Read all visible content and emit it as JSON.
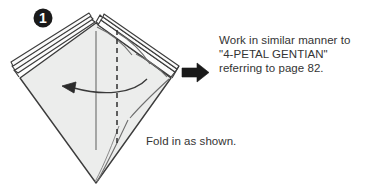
{
  "figure": {
    "kind": "origami-folding-instruction-diagram",
    "step_badge": {
      "number": "1",
      "shape": "filled-circle",
      "fill_color": "#1a1a1a",
      "text_color": "#ffffff"
    },
    "paper": {
      "fill_color": "#ecedec",
      "outline_color": "#3c3c3c",
      "shape": "kite",
      "layer_count_left": 3,
      "layer_count_right": 3
    },
    "fold_line": {
      "style": "dashed",
      "color": "#2f2f2f",
      "orientation": "vertical",
      "label": "valley-fold-line"
    },
    "center_line": {
      "style": "solid",
      "color": "#6b6b6b",
      "orientation": "vertical"
    },
    "fold_arrow": {
      "direction": "right-to-left",
      "style": "curved",
      "color": "#3a3a3a"
    },
    "transition_arrow": {
      "direction": "right",
      "color": "#1a1a1a"
    }
  },
  "instruction": {
    "lines": [
      "Work in similar manner to",
      "\"4-PETAL GENTIAN\"",
      "referring to page 82."
    ],
    "line1": "Work in similar manner to",
    "line2": "\"4-PETAL GENTIAN\"",
    "line3": "referring to page 82.",
    "reference_model": "4-PETAL GENTIAN",
    "reference_page": "82"
  },
  "caption": {
    "text": "Fold in as shown."
  }
}
